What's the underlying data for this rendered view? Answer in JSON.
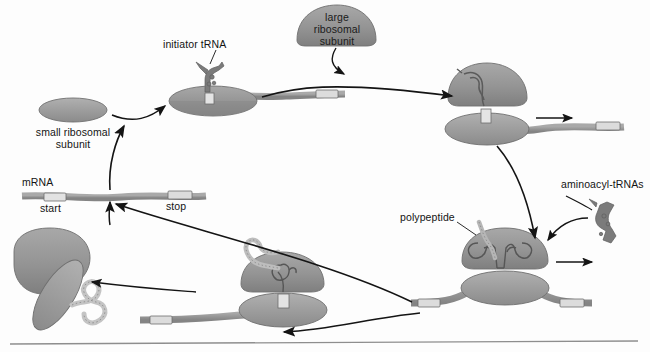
{
  "diagram": {
    "title_absent": true,
    "type": "protein-synthesis-translation-cycle",
    "background_color": "#fdfdfd",
    "ink_color": "#141414"
  },
  "labels": {
    "initiator_trna": "initiator tRNA",
    "large_ribosomal_subunit": "large\nribosomal\nsubunit",
    "small_ribosomal_subunit": "small ribosomal\nsubunit",
    "mrna": "mRNA",
    "start": "start",
    "stop": "stop",
    "aminoacyl_trnas": "aminoacyl-tRNAs",
    "polypeptide": "polypeptide"
  },
  "colors": {
    "subunit_fill": "#8f8f8f",
    "subunit_fill_light": "#a6a6a6",
    "subunit_stroke": "#6f6f6f",
    "mrna_fill": "#9a9a9a",
    "mrna_stroke": "#6d6d6d",
    "codon_fill": "#d9d9d9",
    "trna_fill": "#7a7a7a",
    "peptide_fill": "#cfcfcf",
    "arrow": "#141414",
    "rule": "#8e8e8e"
  },
  "stages": [
    {
      "id": "stage-1-initiation",
      "name": "small subunit plus initiator tRNA on mRNA",
      "components": [
        "small ribosomal subunit",
        "initiator tRNA",
        "mRNA"
      ]
    },
    {
      "id": "stage-2-assembled-ribosome",
      "name": "complete ribosome assembled on mRNA",
      "components": [
        "large ribosomal subunit",
        "small ribosomal subunit",
        "initiator tRNA",
        "mRNA"
      ]
    },
    {
      "id": "stage-3-elongation",
      "name": "elongation with aminoacyl-tRNAs and growing polypeptide",
      "components": [
        "ribosome",
        "aminoacyl-tRNAs",
        "polypeptide",
        "mRNA"
      ]
    },
    {
      "id": "stage-4-termination",
      "name": "ribosome at stop codon with long polypeptide",
      "components": [
        "ribosome",
        "polypeptide",
        "mRNA"
      ]
    },
    {
      "id": "stage-5-release",
      "name": "subunits and finished polypeptide released",
      "components": [
        "large ribosomal subunit",
        "small ribosomal subunit",
        "polypeptide"
      ]
    }
  ],
  "arrows": [
    {
      "from": "small ribosomal subunit",
      "to": "stage-1-initiation"
    },
    {
      "from": "stage-1-initiation",
      "to": "stage-2-assembled-ribosome"
    },
    {
      "from": "large ribosomal subunit",
      "to": "stage-2-assembled-ribosome"
    },
    {
      "from": "stage-2-assembled-ribosome",
      "to": "stage-3-elongation"
    },
    {
      "from": "aminoacyl-tRNAs",
      "to": "stage-3-elongation"
    },
    {
      "from": "stage-3-elongation",
      "to": "stage-4-termination"
    },
    {
      "from": "stage-4-termination",
      "to": "stage-5-release"
    },
    {
      "from": "stage-5-release",
      "to": "mRNA"
    },
    {
      "from": "mRNA",
      "to": "stage-1-initiation"
    }
  ]
}
